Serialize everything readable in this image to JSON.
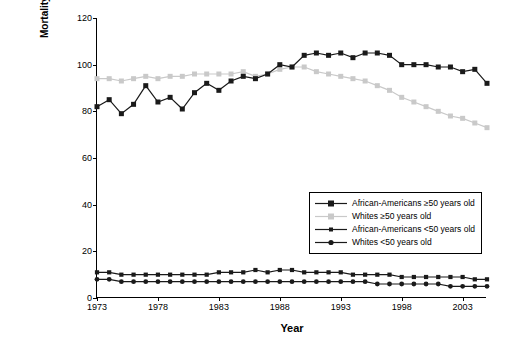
{
  "chart_data": {
    "type": "line",
    "title": "",
    "xlabel": "Year",
    "ylabel": "Mortality rate per 100,000",
    "xlim": [
      1973,
      2005
    ],
    "ylim": [
      0,
      120
    ],
    "ytick_values": [
      0,
      20,
      40,
      60,
      80,
      100,
      120
    ],
    "xtick_values": [
      1973,
      1978,
      1983,
      1988,
      1993,
      1998,
      2003
    ],
    "grid": false,
    "legend_position": "center-right inside plot",
    "x": [
      1973,
      1974,
      1975,
      1976,
      1977,
      1978,
      1979,
      1980,
      1981,
      1982,
      1983,
      1984,
      1985,
      1986,
      1987,
      1988,
      1989,
      1990,
      1991,
      1992,
      1993,
      1994,
      1995,
      1996,
      1997,
      1998,
      1999,
      2000,
      2001,
      2002,
      2003,
      2004,
      2005
    ],
    "series": [
      {
        "name": "African-Americans ≥50 years old",
        "color": "#1a1a1a",
        "marker": "square",
        "values": [
          82,
          85,
          79,
          83,
          91,
          84,
          86,
          81,
          88,
          92,
          89,
          93,
          95,
          94,
          96,
          100,
          99,
          104,
          105,
          104,
          105,
          103,
          105,
          105,
          104,
          100,
          100,
          100,
          99,
          99,
          97,
          98,
          92
        ]
      },
      {
        "name": "Whites ≥50 years old",
        "color": "#c9c9c9",
        "marker": "square",
        "values": [
          94,
          94,
          93,
          94,
          95,
          94,
          95,
          95,
          96,
          96,
          96,
          96,
          97,
          95,
          96,
          98,
          99,
          99,
          97,
          96,
          95,
          94,
          93,
          91,
          89,
          86,
          84,
          82,
          80,
          78,
          77,
          75,
          73
        ]
      },
      {
        "name": "African-Americans <50 years old",
        "color": "#1a1a1a",
        "marker": "square",
        "values": [
          11,
          11,
          10,
          10,
          10,
          10,
          10,
          10,
          10,
          10,
          11,
          11,
          11,
          12,
          11,
          12,
          12,
          11,
          11,
          11,
          11,
          10,
          10,
          10,
          10,
          9,
          9,
          9,
          9,
          9,
          9,
          8,
          8
        ]
      },
      {
        "name": "Whites <50 years old",
        "color": "#1a1a1a",
        "marker": "circle",
        "values": [
          8,
          8,
          7,
          7,
          7,
          7,
          7,
          7,
          7,
          7,
          7,
          7,
          7,
          7,
          7,
          7,
          7,
          7,
          7,
          7,
          7,
          7,
          7,
          6,
          6,
          6,
          6,
          6,
          6,
          5,
          5,
          5,
          5
        ]
      }
    ]
  },
  "legend": {
    "items": [
      {
        "label": "African-Americans ≥50 years old"
      },
      {
        "label": "Whites ≥50 years old"
      },
      {
        "label": "African-Americans <50 years old"
      },
      {
        "label": "Whites <50 years old"
      }
    ]
  }
}
